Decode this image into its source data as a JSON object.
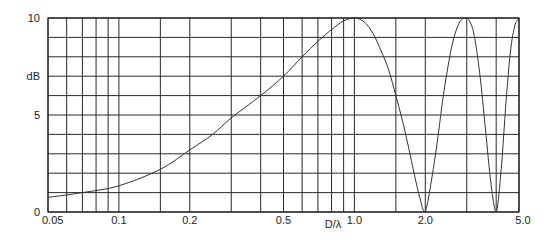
{
  "chart_data": {
    "type": "line",
    "title": "",
    "xlabel": "D/λ",
    "ylabel": "dB",
    "xscale": "log",
    "xlim": [
      0.05,
      5.0
    ],
    "ylim": [
      0,
      10
    ],
    "grid": true,
    "legend": null,
    "x_tick_labels": [
      "0.05",
      "0.1",
      "0.2",
      "0.5",
      "1.0",
      "2.0",
      "5.0"
    ],
    "x_tick_values": [
      0.05,
      0.1,
      0.2,
      0.5,
      1.0,
      2.0,
      5.0
    ],
    "x_grid_values": [
      0.05,
      0.06,
      0.07,
      0.08,
      0.09,
      0.1,
      0.15,
      0.2,
      0.3,
      0.4,
      0.5,
      0.6,
      0.7,
      0.8,
      0.9,
      1.0,
      1.5,
      2.0,
      3.0,
      4.0,
      5.0
    ],
    "y_tick_labels": [
      "0",
      "5",
      "10"
    ],
    "y_tick_values": [
      0,
      5,
      10
    ],
    "y_grid_values": [
      0,
      1,
      2,
      3,
      4,
      5,
      6,
      7,
      8,
      9,
      10
    ],
    "series": [
      {
        "name": "gain",
        "color": "#333333",
        "x": [
          0.05,
          0.07,
          0.1,
          0.15,
          0.2,
          0.25,
          0.3,
          0.4,
          0.5,
          0.6,
          0.7,
          0.8,
          0.9,
          1.0,
          1.1,
          1.2,
          1.3,
          1.4,
          1.5,
          1.6,
          1.7,
          1.8,
          1.9,
          2.0,
          2.2,
          2.4,
          2.6,
          2.8,
          3.0,
          3.2,
          3.4,
          3.6,
          3.8,
          4.0,
          4.2,
          4.4,
          4.6,
          4.8,
          5.0
        ],
        "values": [
          0.75,
          1.0,
          1.35,
          2.2,
          3.2,
          4.0,
          4.85,
          6.0,
          7.0,
          8.0,
          8.8,
          9.4,
          9.85,
          10.0,
          9.8,
          9.2,
          8.3,
          7.3,
          6.0,
          4.7,
          3.3,
          1.9,
          0.7,
          0.0,
          2.8,
          6.2,
          8.6,
          9.8,
          10.0,
          9.3,
          7.2,
          4.3,
          1.5,
          0.0,
          2.2,
          5.6,
          8.3,
          9.6,
          10.0
        ]
      }
    ]
  }
}
